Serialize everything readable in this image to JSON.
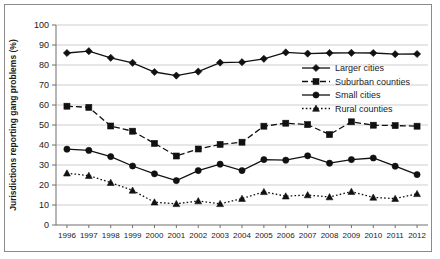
{
  "chart_data": {
    "type": "line",
    "title": "",
    "xlabel": "",
    "ylabel": "Jurisdictions reporting gang problems (%)",
    "ylim": [
      0,
      100
    ],
    "ytick_step": 10,
    "grid": true,
    "legend_position": "right-upper-inside",
    "categories": [
      "1996",
      "1997",
      "1998",
      "1999",
      "2000",
      "2001",
      "2002",
      "2003",
      "2004",
      "2005",
      "2006",
      "2007",
      "2008",
      "2009",
      "2010",
      "2011",
      "2012"
    ],
    "yticks": [
      "0",
      "10",
      "20",
      "30",
      "40",
      "50",
      "60",
      "70",
      "80",
      "90",
      "100"
    ],
    "series": [
      {
        "name": "Larger cities",
        "marker": "diamond",
        "linestyle": "solid",
        "color": "#111111",
        "values": [
          86.0,
          86.9,
          83.6,
          81.1,
          76.5,
          74.7,
          76.7,
          81.2,
          81.4,
          83.1,
          86.3,
          85.7,
          86.0,
          86.1,
          86.0,
          85.4,
          85.5
        ]
      },
      {
        "name": "Suburban counties",
        "marker": "square",
        "linestyle": "dashed",
        "color": "#111111",
        "values": [
          59.4,
          58.8,
          49.5,
          46.9,
          40.8,
          34.5,
          38.0,
          40.3,
          41.4,
          49.4,
          50.9,
          50.2,
          45.2,
          51.6,
          49.9,
          49.7,
          49.4
        ]
      },
      {
        "name": "Small cities",
        "marker": "circle",
        "linestyle": "solid",
        "color": "#111111",
        "values": [
          37.9,
          37.3,
          34.2,
          29.5,
          25.6,
          22.2,
          27.2,
          30.4,
          27.2,
          32.7,
          32.4,
          34.6,
          30.9,
          32.7,
          33.5,
          29.4,
          25.2
        ]
      },
      {
        "name": "Rural counties",
        "marker": "triangle",
        "linestyle": "dotted",
        "color": "#111111",
        "values": [
          25.9,
          24.7,
          21.2,
          17.3,
          11.4,
          10.6,
          12.0,
          10.6,
          13.2,
          16.6,
          14.4,
          15.0,
          14.0,
          16.7,
          13.8,
          13.2,
          15.6
        ]
      }
    ]
  }
}
